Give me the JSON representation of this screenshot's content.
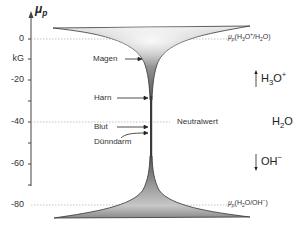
{
  "axis": {
    "label": "μ",
    "label_sub": "p",
    "unit": "kG",
    "ticks": [
      {
        "label": "0",
        "y": 39
      },
      {
        "label": "-20",
        "y": 80
      },
      {
        "label": "-40",
        "y": 122
      },
      {
        "label": "-60",
        "y": 164
      },
      {
        "label": "-80",
        "y": 205
      }
    ]
  },
  "reference_lines": {
    "top": {
      "label_pre": "μ",
      "label_sub": "p",
      "label_text": "(H3O+/H2O)",
      "value": 0
    },
    "neutral": {
      "label": "Neutralwert",
      "value": -40
    },
    "bottom": {
      "label_pre": "μ",
      "label_sub": "p",
      "label_text": "(H2O/OH−)",
      "value": -80
    }
  },
  "annotations": {
    "magen": "Magen",
    "harn": "Harn",
    "blut": "Blut",
    "duenndarm": "Dünndarm"
  },
  "species": {
    "h3o": {
      "base": "H",
      "sub": "3",
      "rest": "O",
      "sup": "+"
    },
    "h2o": {
      "base": "H",
      "sub": "2",
      "rest": "O"
    },
    "oh": {
      "base": "OH",
      "sup": "−"
    }
  },
  "colors": {
    "funnel_dark": "#6a6a6a",
    "funnel_light": "#e6e6e6",
    "axis": "#444444",
    "dotted": "#999999"
  }
}
